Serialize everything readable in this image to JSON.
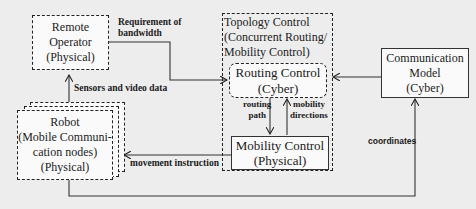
{
  "diagram": {
    "nodes": {
      "remote_operator": {
        "lines": [
          "Remote",
          "Operator",
          "(Physical)"
        ]
      },
      "topology_control": {
        "lines": [
          "Topology Control",
          "(Concurrent Routing/",
          "Mobility Control)"
        ]
      },
      "routing_control": {
        "lines": [
          "Routing Control",
          "(Cyber)"
        ]
      },
      "mobility_control": {
        "lines": [
          "Mobility Control",
          "(Physical)"
        ]
      },
      "communication_model": {
        "lines": [
          "Communication",
          "Model",
          "(Cyber)"
        ]
      },
      "robot": {
        "lines": [
          "Robot",
          "(Mobile Communi-",
          "cation nodes)",
          "(Physical)"
        ]
      }
    },
    "edges": {
      "bandwidth": {
        "lines": [
          "Requirement of",
          "bandwidth"
        ],
        "from": "Remote Operator",
        "to": "Routing Control"
      },
      "sensors": {
        "label": "Sensors and video data",
        "from": "Robot",
        "to": "Remote Operator"
      },
      "routing_path": {
        "lines": [
          "routing",
          "path"
        ],
        "from": "Routing Control",
        "to": "Mobility Control"
      },
      "mobility_directions": {
        "lines": [
          "mobility",
          "directions"
        ],
        "from": "Mobility Control",
        "to": "Routing Control"
      },
      "comm_to_routing": {
        "from": "Communication Model",
        "to": "Routing Control"
      },
      "movement": {
        "label": "movement instruction",
        "from": "Mobility Control",
        "to": "Robot"
      },
      "coordinates": {
        "label": "coordinates",
        "from": "Robot",
        "to": "Communication Model"
      }
    }
  }
}
